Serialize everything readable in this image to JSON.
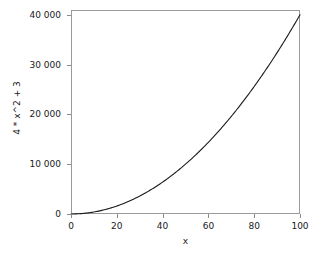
{
  "chart_data": {
    "type": "line",
    "title": "",
    "xlabel": "x",
    "ylabel": "4 * x^2 + 3",
    "xlim": [
      0,
      100
    ],
    "ylim": [
      0,
      40963
    ],
    "grid": false,
    "legend": null,
    "line_color": "#1a1a1a",
    "frame_color": "#9a9a9a",
    "expression": "4*x^2+3",
    "xticks": [
      {
        "value": 0,
        "label": "0"
      },
      {
        "value": 20,
        "label": "20"
      },
      {
        "value": 40,
        "label": "40"
      },
      {
        "value": 60,
        "label": "60"
      },
      {
        "value": 80,
        "label": "80"
      },
      {
        "value": 100,
        "label": "100"
      }
    ],
    "yticks": [
      {
        "value": 0,
        "label": "0"
      },
      {
        "value": 10000,
        "label": "10 000"
      },
      {
        "value": 20000,
        "label": "20 000"
      },
      {
        "value": 30000,
        "label": "30 000"
      },
      {
        "value": 40000,
        "label": "40 000"
      }
    ],
    "x": [
      0,
      5,
      10,
      15,
      20,
      25,
      30,
      35,
      40,
      45,
      50,
      55,
      60,
      65,
      70,
      75,
      80,
      85,
      90,
      95,
      100
    ],
    "y": [
      3,
      103,
      403,
      903,
      1603,
      2503,
      3603,
      4903,
      6403,
      8103,
      10003,
      12103,
      14403,
      16903,
      19603,
      22503,
      25603,
      28903,
      32403,
      36103,
      40003
    ]
  }
}
